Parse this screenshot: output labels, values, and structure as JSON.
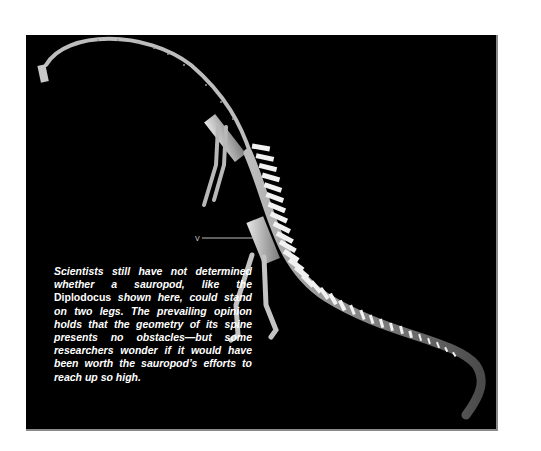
{
  "figure": {
    "background_color": "#000000",
    "frame_color": "#8a8a8a",
    "marker_label": "V",
    "caption": {
      "before": "Scientists still have not determined whether a sauropod, like the ",
      "emphasis": "Diplodocus",
      "after": " shown here, could stand on two legs. The prevailing opinion holds that the geometry of its spine presents no obstacles—but some researchers wonder if it would have been worth the sauropod’s efforts to reach up so high."
    }
  }
}
